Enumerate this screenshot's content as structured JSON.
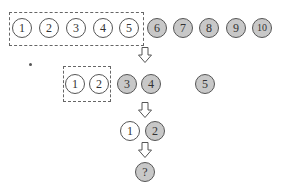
{
  "diagram": {
    "colors": {
      "unselected_fill": "#ffffff",
      "selected_fill": "#c8c8c8",
      "stroke": "#555555"
    },
    "rows": [
      {
        "id": "row1",
        "nodes": [
          {
            "label": "1",
            "filled": false
          },
          {
            "label": "2",
            "filled": false
          },
          {
            "label": "3",
            "filled": false
          },
          {
            "label": "4",
            "filled": false
          },
          {
            "label": "5",
            "filled": false
          },
          {
            "label": "6",
            "filled": true
          },
          {
            "label": "7",
            "filled": true
          },
          {
            "label": "8",
            "filled": true
          },
          {
            "label": "9",
            "filled": true
          },
          {
            "label": "10",
            "filled": true
          }
        ],
        "dashed_group": [
          "1",
          "2",
          "3",
          "4",
          "5"
        ]
      },
      {
        "id": "row2",
        "nodes": [
          {
            "label": "1",
            "filled": false
          },
          {
            "label": "2",
            "filled": false
          },
          {
            "label": "3",
            "filled": true
          },
          {
            "label": "4",
            "filled": true
          },
          {
            "label": "5",
            "filled": true
          }
        ],
        "dashed_group": [
          "1",
          "2"
        ]
      },
      {
        "id": "row3",
        "nodes": [
          {
            "label": "1",
            "filled": false
          },
          {
            "label": "2",
            "filled": true
          }
        ]
      },
      {
        "id": "row4",
        "nodes": [
          {
            "label": "?",
            "filled": true
          }
        ]
      }
    ],
    "arrows": [
      "down-arrow",
      "down-arrow",
      "down-arrow"
    ]
  }
}
